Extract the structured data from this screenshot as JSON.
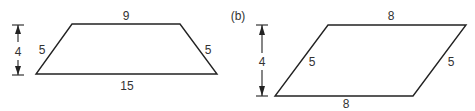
{
  "figures": [
    {
      "id": "a",
      "shape": "isosceles-trapezoid",
      "caption": "",
      "top_length": "9",
      "bottom_length": "15",
      "left_side": "5",
      "right_side": "5",
      "height": "4"
    },
    {
      "id": "b",
      "shape": "parallelogram",
      "caption": "(b)",
      "top_length": "8",
      "bottom_length": "8",
      "left_side": "5",
      "right_side": "5",
      "height": "4"
    }
  ],
  "colors": {
    "stroke": "#222222",
    "text": "#333333",
    "background": "#ffffff"
  }
}
